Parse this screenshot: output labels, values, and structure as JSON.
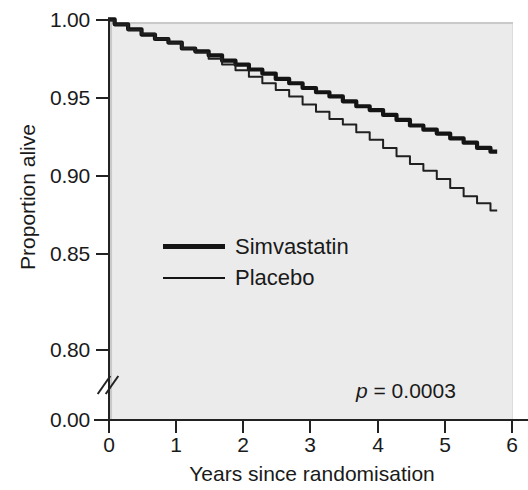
{
  "chart_data": {
    "type": "line",
    "title": "",
    "xlabel": "Years since randomisation",
    "ylabel": "Proportion alive",
    "xlim": [
      0,
      6
    ],
    "ylim": [
      0.78,
      1.0
    ],
    "y_axis_break": true,
    "grid": false,
    "legend_position": "inner-center-left",
    "annotation": "p = 0.0003",
    "annotation_p_symbol": "p",
    "annotation_p_rest": " = 0.0003",
    "x_ticks": [
      "0",
      "1",
      "2",
      "3",
      "4",
      "5",
      "6"
    ],
    "x_tick_values": [
      0,
      1,
      2,
      3,
      4,
      5,
      6
    ],
    "y_ticks": [
      "1.00",
      "0.95",
      "0.90",
      "0.85",
      "0.80",
      "0.00"
    ],
    "y_tick_values": [
      1.0,
      0.95,
      0.9,
      0.85,
      0.8,
      0.0
    ],
    "series": [
      {
        "name": "Simvastatin",
        "line_style": "thick",
        "color": "#141414",
        "x": [
          0.0,
          0.2,
          0.4,
          0.6,
          0.8,
          1.0,
          1.2,
          1.4,
          1.6,
          1.8,
          2.0,
          2.2,
          2.4,
          2.6,
          2.8,
          3.0,
          3.2,
          3.4,
          3.6,
          3.8,
          4.0,
          4.2,
          4.4,
          4.6,
          4.8,
          5.0,
          5.2,
          5.4,
          5.6,
          5.8
        ],
        "y": [
          1.0,
          0.997,
          0.994,
          0.991,
          0.988,
          0.985,
          0.982,
          0.98,
          0.977,
          0.974,
          0.971,
          0.968,
          0.965,
          0.962,
          0.959,
          0.956,
          0.953,
          0.95,
          0.947,
          0.944,
          0.941,
          0.938,
          0.935,
          0.932,
          0.929,
          0.926,
          0.923,
          0.92,
          0.917,
          0.915
        ]
      },
      {
        "name": "Placebo",
        "line_style": "thin",
        "color": "#202020",
        "x": [
          0.0,
          0.2,
          0.4,
          0.6,
          0.8,
          1.0,
          1.2,
          1.4,
          1.6,
          1.8,
          2.0,
          2.2,
          2.4,
          2.6,
          2.8,
          3.0,
          3.2,
          3.4,
          3.6,
          3.8,
          4.0,
          4.2,
          4.4,
          4.6,
          4.8,
          5.0,
          5.2,
          5.4,
          5.6,
          5.8
        ],
        "y": [
          1.0,
          0.997,
          0.994,
          0.991,
          0.988,
          0.985,
          0.982,
          0.979,
          0.975,
          0.971,
          0.967,
          0.963,
          0.959,
          0.954,
          0.95,
          0.945,
          0.941,
          0.936,
          0.932,
          0.927,
          0.922,
          0.917,
          0.912,
          0.907,
          0.902,
          0.897,
          0.891,
          0.886,
          0.881,
          0.876
        ]
      }
    ]
  },
  "axis": {
    "y_title": "Proportion alive",
    "x_title": "Years since randomisation",
    "y_labels": [
      "1.00",
      "0.95",
      "0.90",
      "0.85",
      "0.80",
      "0.00"
    ],
    "x_labels": [
      "0",
      "1",
      "2",
      "3",
      "4",
      "5",
      "6"
    ]
  },
  "legend": {
    "items": [
      {
        "label": "Simvastatin",
        "style": "thick"
      },
      {
        "label": "Placebo",
        "style": "thin"
      }
    ]
  },
  "annotation": {
    "p_symbol": "p",
    "p_rest": " = 0.0003",
    "full": "p = 0.0003"
  },
  "colors": {
    "panel_background": "#ebebeb",
    "panel_shadow": "#c9c9c9",
    "axis": "#222222",
    "simvastatin": "#141414",
    "placebo": "#202020",
    "text": "#1a1a1a",
    "page_background": "#ffffff"
  }
}
